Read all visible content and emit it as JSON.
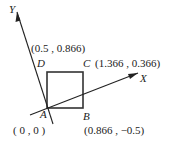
{
  "diagram": {
    "axes": {
      "x_label": "X",
      "y_label": "Y"
    },
    "points": {
      "A": {
        "name": "A",
        "coords": "( 0 , 0 )"
      },
      "B": {
        "name": "B",
        "coords": "(0.866 , −0.5)"
      },
      "C": {
        "name": "C",
        "coords": "(1.366 , 0.366)"
      },
      "D": {
        "name": "D",
        "coords": "(0.5 , 0.866)"
      }
    },
    "colors": {
      "line": "#222222",
      "square": "#333333"
    }
  }
}
